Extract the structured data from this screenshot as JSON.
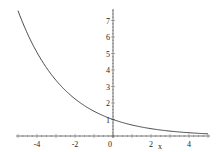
{
  "chart_data": {
    "type": "line",
    "title": "",
    "xlabel": "x",
    "ylabel": "",
    "function": "y = (2/3)^x",
    "xlim": [
      -5,
      5
    ],
    "ylim": [
      0,
      7.7
    ],
    "grid": false,
    "legend": null,
    "x_ticks": [
      -4,
      -2,
      0,
      2,
      4
    ],
    "x_tick_labels": [
      "-4",
      "-2",
      "0",
      "2",
      "4"
    ],
    "y_ticks": [
      1,
      2,
      3,
      4,
      5,
      6,
      7
    ],
    "y_tick_labels": [
      "1",
      "2",
      "3",
      "4",
      "5",
      "6",
      "7"
    ],
    "series": [
      {
        "name": "curve",
        "color": "#333333",
        "x": [
          -5,
          -4,
          -3,
          -2,
          -1,
          0,
          1,
          2,
          3,
          4,
          5
        ],
        "y": [
          7.59,
          5.06,
          3.38,
          2.25,
          1.5,
          1.0,
          0.67,
          0.44,
          0.3,
          0.2,
          0.13
        ]
      }
    ]
  }
}
